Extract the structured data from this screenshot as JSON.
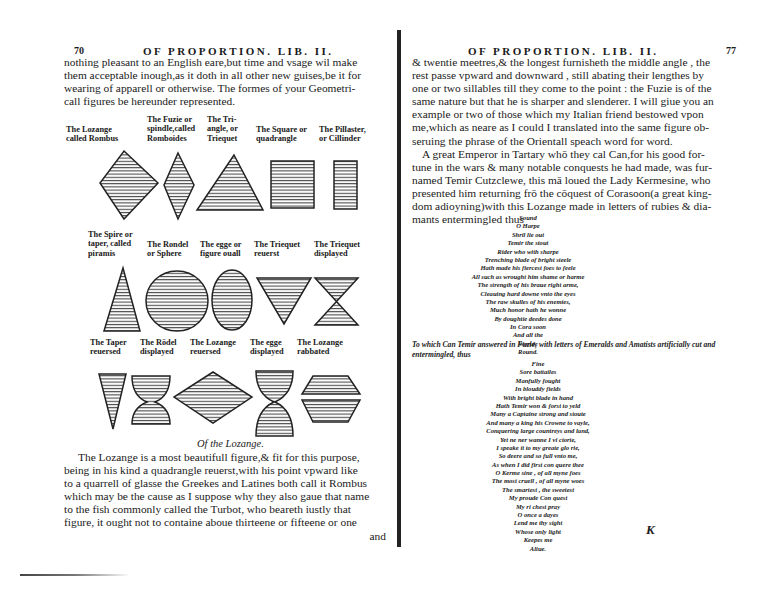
{
  "left_page": {
    "folio": "70",
    "running_head": "OF PROPORTION. LIB. II.",
    "intro_lines": [
      "nothing pleasant to an English eare,but time and vsage wil make",
      "them acceptable inough,as it doth in all other new guises,be it for",
      "wearing of apparell or otherwise. The formes of your Geometri-",
      "call figures be hereunder represented."
    ],
    "figure_rows": [
      {
        "labels": [
          "The Lozange\ncalled Rombus",
          "The Fuzie or\nspindle,called\nRomboides",
          "The Tri-\nangle, or\nTriequet",
          "The Square or\nquadrangle",
          "The Pillaster,\nor Cillinder"
        ],
        "shapes": [
          "lozange",
          "fuzie",
          "triangle",
          "square",
          "pillaster"
        ]
      },
      {
        "labels": [
          "The Spire or\ntaper, called\npiramis",
          "The Rondel\nor Sphere",
          "The egge or\nfigure ouall",
          "The Triequet\nreuerst",
          "The Triequet\ndisplayed"
        ],
        "shapes": [
          "spire",
          "rondel",
          "egge",
          "triequet-reuerst",
          "triequet-displayed"
        ]
      },
      {
        "labels": [
          "The Taper\nreuersed",
          "The Rōdel\ndisplayed",
          "The Lozange\nreuersed",
          "The egge\ndisplayed",
          "The Lozange\nrabbated"
        ],
        "shapes": [
          "taper-reuersed",
          "rondel-displayed",
          "lozange-reuersed",
          "egge-displayed",
          "lozange-rabbated"
        ]
      }
    ],
    "section_caption": "Of the Lozange.",
    "closing_lines": [
      "The Lozange is a most beautifull figure,& fit for this purpose,",
      "being in his kind a quadrangle reuerst,with his point vpward like",
      "to a quarrell of glasse the Greekes and Latines both call it Rombus",
      "which may be the cause as I suppose why they also gaue that name",
      "to the fish commonly called the Turbot, who beareth iustly that",
      "figure, it ought not to containe aboue thirteene or fifteene or one"
    ],
    "catchword": "and"
  },
  "right_page": {
    "folio": "77",
    "running_head": "OF PROPORTION. LIB. II.",
    "paragraph_lines": [
      "& twentie meetres,& the longest furnisheth the middle angle , the",
      "rest passe vpward and downward , still abating their lengthes by",
      "one or two sillables till they come to the point : the Fuzie is of the",
      "same nature but that he is sharper and slenderer. I will giue you an",
      "example or two of those which my Italian friend bestowed vpon",
      "me,which as neare as I could I translated into the same figure ob-",
      "seruing the phrase of the Orientall speach word for word.",
      "A great Emperor in Tartary whō they cal Can,for his good for-",
      "tune in the wars & many notable conquests he had made, was fur-",
      "named Temir Cutzclewe, this mā loued the Lady Kermesine, who",
      "presented him returning frō the cōquest of Corasoon(a great king-",
      "dom adioyning)with this Lozange made in letters of rubies & dia-",
      "mants entermingled thus"
    ],
    "lozange_poem": [
      "Sound",
      "O  Harpe",
      "Shril  lie  out",
      "Temir  the  stout",
      "Rider  who  with  sharpe",
      "Trenching blade of bright steele",
      "Hath made  his fiercest foes to feele",
      "All such as wrought him shame or harme",
      "The strength of his braue right arme,",
      "Cleauing hard downe vnto the eyes",
      "The raw skulles of his enemies,",
      "Much honor hath he wonne",
      "By doughtie deedes done",
      "In  Cora  soon",
      "And  all  the",
      "Worlde",
      "Round."
    ],
    "fuzie_intro": "To which Can Temir answered in Fuzie, with letters of Emeralds and Amatists artificially cut and entermingled, thus",
    "fuzie_poem": [
      "Fine",
      "Sore battailes",
      "Manfully fought",
      "In  blouddy  fields",
      "With bright blade in hand",
      "Hath Temir won & forst to yeld",
      "Many a Captaine strong and stoute",
      "And many a king his Crowne to vayle,",
      "Conquering  large  countreys  and  land,",
      "Yet  ne  ner  wanne  I  vi  ctorie,",
      "I  speake  it  to  my  greate  glo  rie,",
      "So  deere  and  so  full  vnto  me,",
      "As  when  I  did  first  con  quere  thee",
      "O  Kerme  sine ,  of  all  myne  foes",
      "The  most  cruell ,  of  all  myne  woes",
      "The  smartest ,  the  sweetest",
      "My  proude  Con  quest",
      "My  ri  chest  pray",
      "O  once  a  dayes",
      "Lend  me  thy  sight",
      "Whose only light",
      "Keepes  me",
      "Aliue."
    ],
    "margin_mark": "K"
  }
}
